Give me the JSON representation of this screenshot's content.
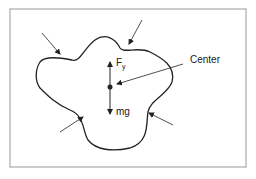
{
  "diagram": {
    "type": "free-body diagram",
    "labels": {
      "force_up": "F",
      "force_up_subscript": "y",
      "force_down": "mg",
      "center": "Center"
    },
    "elements": [
      {
        "name": "irregular-body-outline"
      },
      {
        "name": "center-point"
      },
      {
        "name": "surface-pressure-arrows",
        "count": 4
      },
      {
        "name": "buoyant-force-arrow",
        "direction": "up"
      },
      {
        "name": "weight-arrow",
        "direction": "down"
      }
    ],
    "colors": {
      "stroke": "#222222",
      "frame": "#888888",
      "background": "#ffffff"
    }
  }
}
